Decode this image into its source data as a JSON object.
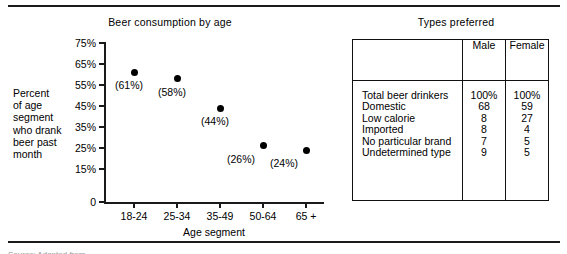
{
  "chart_data": {
    "type": "scatter",
    "title": "Beer consumption by age",
    "xlabel": "Age segment",
    "ylabel": "Percent\nof age\nsegment\nwho drank\nbeer past\nmonth",
    "ylabel_lines": [
      "Percent",
      "of age",
      "segment",
      "who drank",
      "beer past",
      "month"
    ],
    "categories": [
      "18-24",
      "25-34",
      "35-49",
      "50-64",
      "65 +"
    ],
    "values": [
      61,
      58,
      44,
      26,
      24
    ],
    "point_labels": [
      "(61%)",
      "(58%)",
      "(44%)",
      "(26%)",
      "(24%)"
    ],
    "ytick_labels": [
      "75%",
      "65%",
      "55%",
      "45%",
      "35%",
      "25%",
      "15%",
      "0"
    ],
    "ytick_values": [
      75,
      65,
      55,
      45,
      35,
      25,
      15,
      0
    ],
    "ylim": [
      0,
      75
    ],
    "grid": false,
    "legend": false,
    "marker_color": "#000000",
    "axis_color": "#1a1a1a"
  },
  "table_panel": {
    "title": "Types preferred",
    "columns": [
      "",
      "Male",
      "Female"
    ],
    "rows": [
      {
        "label": "Total beer drinkers",
        "male": "100%",
        "female": "100%"
      },
      {
        "label": "Domestic",
        "male": "68",
        "female": "59"
      },
      {
        "label": "Low calorie",
        "male": "8",
        "female": "27"
      },
      {
        "label": "Imported",
        "male": "8",
        "female": "4"
      },
      {
        "label": "No particular brand",
        "male": "7",
        "female": "5"
      },
      {
        "label": "Undetermined type",
        "male": "9",
        "female": "5"
      }
    ]
  },
  "footer": {
    "cutoff_text": "Source: Adapted from"
  }
}
